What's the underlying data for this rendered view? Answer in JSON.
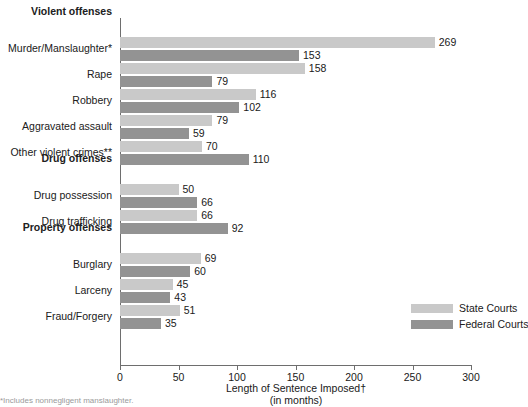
{
  "chart_data": {
    "type": "bar",
    "orientation": "horizontal",
    "title": "",
    "xlabel": "Length of Sentence Imposed†",
    "xlabel_sub": "(in months)",
    "ylabel": "",
    "xlim": [
      0,
      300
    ],
    "xticks": [
      0,
      50,
      100,
      150,
      200,
      250,
      300
    ],
    "grid": false,
    "legend_position": "bottom-right",
    "series": [
      {
        "name": "State Courts",
        "color": "#c9c9c9",
        "values": [
          269,
          158,
          116,
          79,
          70,
          50,
          66,
          69,
          45,
          51
        ]
      },
      {
        "name": "Federal Courts",
        "color": "#939393",
        "values": [
          153,
          79,
          102,
          59,
          110,
          66,
          92,
          60,
          43,
          35
        ]
      }
    ],
    "categories": [
      "Murder/Manslaughter*",
      "Rape",
      "Robbery",
      "Aggravated assault",
      "Other violent crimes**",
      "Drug possession",
      "Drug trafficking",
      "Burglary",
      "Larceny",
      "Fraud/Forgery"
    ],
    "groups": [
      {
        "label": "Violent offenses",
        "categories": [
          "Murder/Manslaughter*",
          "Rape",
          "Robbery",
          "Aggravated assault",
          "Other violent crimes**"
        ]
      },
      {
        "label": "Drug offenses",
        "categories": [
          "Drug possession",
          "Drug trafficking"
        ]
      },
      {
        "label": "Property offenses",
        "categories": [
          "Burglary",
          "Larceny",
          "Fraud/Forgery"
        ]
      }
    ],
    "rows": [
      {
        "kind": "group",
        "label": "Violent offenses"
      },
      {
        "kind": "category",
        "label": "Murder/Manslaughter*",
        "state": 269,
        "federal": 153
      },
      {
        "kind": "category",
        "label": "Rape",
        "state": 158,
        "federal": 79
      },
      {
        "kind": "category",
        "label": "Robbery",
        "state": 116,
        "federal": 102
      },
      {
        "kind": "category",
        "label": "Aggravated assault",
        "state": 79,
        "federal": 59
      },
      {
        "kind": "category",
        "label": "Other violent crimes**",
        "state": 70,
        "federal": 110
      },
      {
        "kind": "group",
        "label": "Drug offenses"
      },
      {
        "kind": "category",
        "label": "Drug possession",
        "state": 50,
        "federal": 66
      },
      {
        "kind": "category",
        "label": "Drug trafficking",
        "state": 66,
        "federal": 92
      },
      {
        "kind": "group",
        "label": "Property offenses"
      },
      {
        "kind": "category",
        "label": "Burglary",
        "state": 69,
        "federal": 60
      },
      {
        "kind": "category",
        "label": "Larceny",
        "state": 45,
        "federal": 43
      },
      {
        "kind": "category",
        "label": "Fraud/Forgery",
        "state": 51,
        "federal": 35
      }
    ]
  },
  "legend": {
    "items": [
      {
        "label": "State Courts",
        "color": "#c9c9c9",
        "key": "state"
      },
      {
        "label": "Federal Courts",
        "color": "#939393",
        "key": "federal"
      }
    ]
  },
  "axis": {
    "title_line1": "Length of Sentence Imposed†",
    "title_line2": "(in months)",
    "tick_labels": [
      "0",
      "50",
      "100",
      "150",
      "200",
      "250",
      "300"
    ]
  },
  "footnote": {
    "text": "*Includes nonnegligent manslaughter."
  },
  "colors": {
    "state": "#c9c9c9",
    "federal": "#939393",
    "axis": "#6e6e6e",
    "text": "#202020",
    "background": "#ffffff"
  }
}
